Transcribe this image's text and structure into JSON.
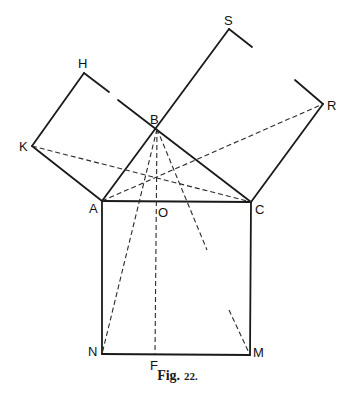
{
  "figure": {
    "caption_prefix": "Fig.",
    "caption_number": "22.",
    "points": {
      "A": {
        "label": "A",
        "x": 102,
        "y": 201
      },
      "B": {
        "label": "B",
        "x": 157,
        "y": 129
      },
      "C": {
        "label": "C",
        "x": 251,
        "y": 202
      },
      "O": {
        "label": "O",
        "x": 157,
        "y": 202
      },
      "H": {
        "label": "H",
        "x": 84,
        "y": 73
      },
      "K": {
        "label": "K",
        "x": 32,
        "y": 146
      },
      "S": {
        "label": "S",
        "x": 229,
        "y": 29
      },
      "R": {
        "label": "R",
        "x": 323,
        "y": 104
      },
      "N": {
        "label": "N",
        "x": 102,
        "y": 354
      },
      "M": {
        "label": "M",
        "x": 250,
        "y": 355
      },
      "F": {
        "label": "F",
        "x": 155,
        "y": 355
      }
    },
    "solid_lines": [
      [
        "K",
        "H"
      ],
      [
        "H",
        "gap_start_BH"
      ],
      [
        "gap_end_BH",
        "C"
      ],
      [
        "K",
        "A"
      ],
      [
        "A",
        "S"
      ],
      [
        "S",
        "stub_S"
      ],
      [
        "stub_R",
        "R"
      ],
      [
        "R",
        "C"
      ],
      [
        "A",
        "C"
      ],
      [
        "A",
        "N"
      ],
      [
        "C",
        "M"
      ],
      [
        "N",
        "M"
      ]
    ],
    "dashed_lines": [
      [
        "K",
        "C"
      ],
      [
        "A",
        "R"
      ],
      [
        "B",
        "N"
      ],
      [
        "B",
        "F"
      ],
      [
        "B",
        "partial_end_1"
      ],
      [
        "partial_start_2",
        "M"
      ]
    ]
  }
}
